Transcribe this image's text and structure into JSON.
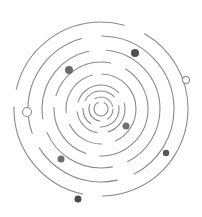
{
  "graphic": {
    "title": "",
    "background": "#ffffff",
    "stroke_color": "#8a8a8a",
    "center": {
      "x": 101,
      "y": 109
    },
    "rings": [
      {
        "r": 7,
        "dash": "30 6",
        "offset": 0
      },
      {
        "r": 12,
        "dash": "22 8",
        "offset": 10
      },
      {
        "r": 18,
        "dash": "34 10 18 8",
        "offset": 5
      },
      {
        "r": 24,
        "dash": "50 12 30 10",
        "offset": 20
      },
      {
        "r": 35,
        "dash": "70 14 40 12 50 10",
        "offset": 30
      },
      {
        "r": 47,
        "dash": "90 14 60 12 70 16",
        "offset": 15
      },
      {
        "r": 59,
        "dash": "110 16 80 14 90 18",
        "offset": 45
      },
      {
        "r": 73,
        "dash": "140 18 90 16 120 20",
        "offset": 60
      },
      {
        "r": 87,
        "dash": "160 20 120 18 140 22",
        "offset": 25
      }
    ],
    "dots": [
      {
        "cx": 135,
        "cy": 53,
        "r": 4,
        "color": "#505050",
        "type": "filled"
      },
      {
        "cx": 69,
        "cy": 70,
        "r": 4,
        "color": "#6a6a6a",
        "type": "filled"
      },
      {
        "cx": 126,
        "cy": 126,
        "r": 3.5,
        "color": "#6e6e6e",
        "type": "filled"
      },
      {
        "cx": 61,
        "cy": 159,
        "r": 3.5,
        "color": "#6e6e6e",
        "type": "filled"
      },
      {
        "cx": 166,
        "cy": 153,
        "r": 3.2,
        "color": "#555555",
        "type": "filled"
      },
      {
        "cx": 78,
        "cy": 199,
        "r": 3.5,
        "color": "#4a4a4a",
        "type": "filled"
      },
      {
        "cx": 186,
        "cy": 80,
        "r": 3.5,
        "color": "#ffffff",
        "type": "hollow"
      },
      {
        "cx": 27,
        "cy": 112,
        "r": 4.5,
        "color": "#ffffff",
        "type": "hollow"
      }
    ]
  }
}
